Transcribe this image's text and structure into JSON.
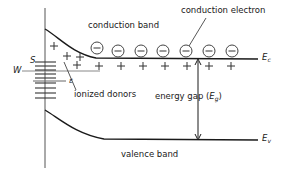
{
  "figure": {
    "type": "semiconductor-energy-band-diagram",
    "width": 292,
    "height": 175,
    "background": "#ffffff",
    "line_color": "#1a1a1a",
    "text_color": "#1a1a1a"
  },
  "labels": {
    "conduction_band": "conduction band",
    "conduction_electron": "conduction electron",
    "ionized_donors": "ionized donors",
    "valence_band": "valence band",
    "energy_gap_text": "energy gap (",
    "energy_gap_symbol": "E",
    "energy_gap_subscript": "g",
    "energy_gap_close": ")",
    "fermi_level": "W",
    "donor_level": "S",
    "binding_energy": "ε",
    "ec_symbol": "E",
    "ec_subscript": "c",
    "ev_symbol": "E",
    "ev_subscript": "v"
  },
  "charges": {
    "electron_glyph": "−",
    "hole_glyph": "+",
    "electron_count": 7,
    "plus_count_lower": 8,
    "plus_count_upper": 3
  },
  "electrons": [
    {
      "x": 97,
      "y": 48
    },
    {
      "x": 118,
      "y": 51
    },
    {
      "x": 141,
      "y": 51
    },
    {
      "x": 163,
      "y": 51
    },
    {
      "x": 186,
      "y": 51
    },
    {
      "x": 209,
      "y": 51
    },
    {
      "x": 232,
      "y": 51
    }
  ],
  "plus_lower": [
    {
      "x": 77,
      "y": 65
    },
    {
      "x": 99,
      "y": 66
    },
    {
      "x": 121,
      "y": 66
    },
    {
      "x": 143,
      "y": 66
    },
    {
      "x": 165,
      "y": 66
    },
    {
      "x": 187,
      "y": 66
    },
    {
      "x": 209,
      "y": 66
    },
    {
      "x": 231,
      "y": 66
    }
  ],
  "plus_upper": [
    {
      "x": 54,
      "y": 46
    },
    {
      "x": 67,
      "y": 56
    },
    {
      "x": 80,
      "y": 57
    }
  ],
  "geometry": {
    "y_axis_x": 45,
    "y_axis_top": 8,
    "y_axis_bottom": 168,
    "ec_right_y": 59,
    "ev_right_y": 140,
    "w_line_y": 71,
    "epsilon_line_y": 81,
    "band_right_x": 258,
    "ladder_ticks": 9
  }
}
